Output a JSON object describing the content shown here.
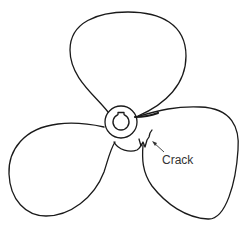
{
  "figure": {
    "annotations": [
      {
        "id": "crack",
        "label": "Crack"
      }
    ],
    "colors": {
      "line": "#1a1a1a",
      "label": "#333333",
      "background": "#ffffff"
    }
  }
}
